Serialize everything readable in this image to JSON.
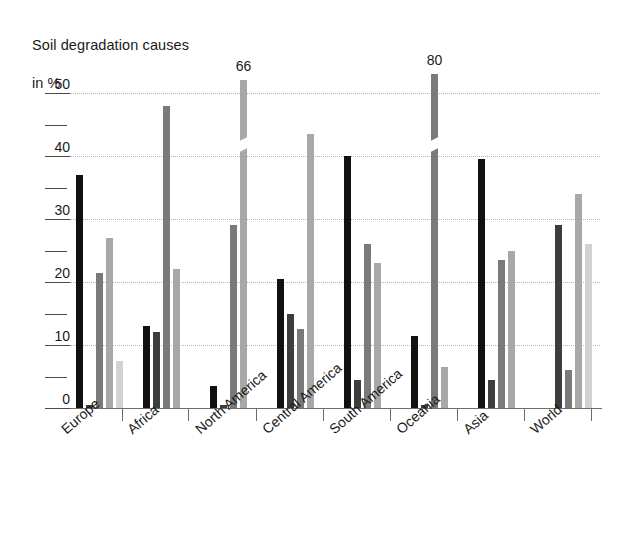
{
  "chart_data": {
    "type": "bar",
    "title": "Soil degradation causes\nin %",
    "title_line1": "Soil degradation causes",
    "title_line2": "in %",
    "xlabel": "",
    "ylabel": "",
    "ylim": [
      0,
      50
    ],
    "grid": true,
    "legend": "none",
    "y_major_ticks": [
      0,
      10,
      20,
      30,
      40,
      50
    ],
    "y_minor_ticks": [
      5,
      15,
      25,
      35,
      45
    ],
    "y_tick_labels": [
      "0",
      "10",
      "20",
      "30",
      "40",
      "50"
    ],
    "categories": [
      "Europe",
      "Africa",
      "North America",
      "Central America",
      "South America",
      "Oceania",
      "Asia",
      "World"
    ],
    "series": [
      {
        "name": "series-1",
        "color": "#111111",
        "values": [
          37,
          13,
          3.5,
          20.5,
          40,
          11.5,
          39.5,
          null
        ]
      },
      {
        "name": "series-2",
        "color": "#3d3d3d",
        "values": [
          0.4,
          12,
          0.4,
          15,
          4.5,
          0.4,
          4.5,
          29
        ]
      },
      {
        "name": "series-3",
        "color": "#7a7a7a",
        "values": [
          21.5,
          48,
          29,
          12.5,
          26,
          80,
          23.5,
          6
        ]
      },
      {
        "name": "series-4",
        "color": "#a8a8a8",
        "values": [
          27,
          22,
          52,
          43.5,
          23,
          6.5,
          25,
          34
        ]
      },
      {
        "name": "series-5",
        "color": "#d2d2d2",
        "values": [
          7.5,
          null,
          null,
          null,
          null,
          null,
          null,
          26
        ]
      }
    ],
    "annotations": [
      {
        "text": "66",
        "category": "North America",
        "series": "series-4",
        "note": "bar truncated with axis break; true value 66"
      },
      {
        "text": "80",
        "category": "Oceania",
        "series": "series-3",
        "note": "bar truncated with axis break; true value 80"
      }
    ],
    "broken_bars": [
      {
        "category": "North America",
        "series": "series-4",
        "drawn_top": 52,
        "actual_value": 66
      },
      {
        "category": "Oceania",
        "series": "series-3",
        "drawn_top": 53,
        "actual_value": 80
      }
    ]
  },
  "axis": {
    "y_unit_note": "percent",
    "x_tick_positions": [
      122,
      188,
      256,
      323,
      390,
      457,
      524,
      591
    ]
  },
  "colors": {
    "background": "#ffffff",
    "axis": "#6e6e6e",
    "grid": "#b4b4b4",
    "text": "#1a1a1a"
  }
}
